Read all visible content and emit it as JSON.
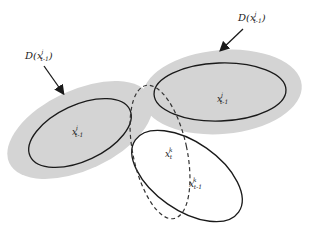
{
  "diagram": {
    "colors": {
      "shade": "#d4d4d4",
      "stroke": "#1a1a1a",
      "background": "#ffffff"
    },
    "callouts": [
      {
        "id": "left",
        "text_main": "D(",
        "var": "x",
        "sup": "i",
        "sub": "t-1",
        "close": ")"
      },
      {
        "id": "right",
        "text_main": "D(",
        "var": "x",
        "sup": "j",
        "sub": "t-1",
        "close": ")"
      }
    ],
    "points": [
      {
        "id": "xi",
        "var": "x",
        "sup": "i",
        "sub": "t-1"
      },
      {
        "id": "xj",
        "var": "x",
        "sup": "j",
        "sub": "t-1"
      },
      {
        "id": "xk_t",
        "var": "x",
        "sup": "k",
        "sub": "t"
      },
      {
        "id": "xk_prev",
        "var": "x",
        "sup": "k",
        "sub": "t-1"
      }
    ]
  }
}
